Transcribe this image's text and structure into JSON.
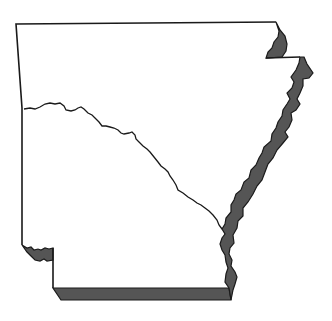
{
  "map": {
    "subject": "Arkansas state outline",
    "features": [
      {
        "name": "state-boundary",
        "style": "outline"
      },
      {
        "name": "river",
        "style": "line"
      },
      {
        "name": "northeast-shaded-strip",
        "style": "shaded"
      },
      {
        "name": "eastern-shaded-band",
        "style": "shaded"
      },
      {
        "name": "southwest-shaded-notch",
        "style": "shaded"
      },
      {
        "name": "southern-shaded-strip",
        "style": "shaded"
      }
    ],
    "colors": {
      "background": "#ffffff",
      "outline": "#1a1a1a",
      "shade": "#555555"
    }
  }
}
